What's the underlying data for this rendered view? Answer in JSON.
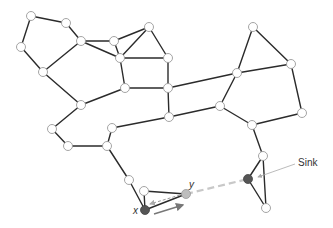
{
  "diagram": {
    "labels": {
      "sink": "Sink",
      "x": "x",
      "y": "y"
    },
    "colors": {
      "edge": "#2b2b2b",
      "node_fill": "#ffffff",
      "node_stroke": "#9a9a9a",
      "sink": "#555555",
      "x_node": "#555555",
      "y_node": "#bdbdbd",
      "dashed_link": "#c8c8c8",
      "arrow": "#777777"
    },
    "nodes": [
      {
        "id": "n0",
        "x": 31,
        "y": 16
      },
      {
        "id": "n1",
        "x": 66,
        "y": 23
      },
      {
        "id": "n2",
        "x": 21,
        "y": 47
      },
      {
        "id": "n3",
        "x": 81,
        "y": 41
      },
      {
        "id": "n4",
        "x": 114,
        "y": 41
      },
      {
        "id": "n5",
        "x": 149,
        "y": 27
      },
      {
        "id": "n6",
        "x": 120,
        "y": 58
      },
      {
        "id": "n7",
        "x": 168,
        "y": 58
      },
      {
        "id": "n8",
        "x": 43,
        "y": 72
      },
      {
        "id": "n9",
        "x": 125,
        "y": 88
      },
      {
        "id": "n10",
        "x": 168,
        "y": 88
      },
      {
        "id": "n11",
        "x": 81,
        "y": 105
      },
      {
        "id": "n12",
        "x": 253,
        "y": 27
      },
      {
        "id": "n13",
        "x": 291,
        "y": 64
      },
      {
        "id": "n14",
        "x": 237,
        "y": 73
      },
      {
        "id": "n15",
        "x": 220,
        "y": 106
      },
      {
        "id": "n16",
        "x": 302,
        "y": 113
      },
      {
        "id": "n17",
        "x": 52,
        "y": 129
      },
      {
        "id": "n18",
        "x": 169,
        "y": 117
      },
      {
        "id": "n19",
        "x": 112,
        "y": 128
      },
      {
        "id": "n20",
        "x": 252,
        "y": 125
      },
      {
        "id": "n21",
        "x": 68,
        "y": 146
      },
      {
        "id": "n22",
        "x": 107,
        "y": 146
      },
      {
        "id": "n23",
        "x": 129,
        "y": 180
      },
      {
        "id": "n24",
        "x": 144,
        "y": 191
      },
      {
        "id": "n25",
        "x": 263,
        "y": 156
      },
      {
        "id": "n26",
        "x": 266,
        "y": 208
      }
    ]
  }
}
